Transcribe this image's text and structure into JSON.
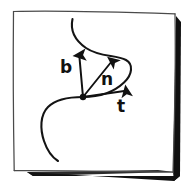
{
  "figure": {
    "title": "Frenet frame sketch",
    "style": "hand-drawn pen sketch",
    "canvas": {
      "width": 186,
      "height": 187
    },
    "colors": {
      "ink": "#111111",
      "paper": "#ffffff",
      "shadow": "#0d0d0d",
      "frame_line": "#5a5a5a"
    }
  },
  "frame": {
    "name": "sketched-square-border",
    "corners": [
      {
        "x": 13,
        "y": 11
      },
      {
        "x": 175,
        "y": 14
      },
      {
        "x": 173,
        "y": 173
      },
      {
        "x": 14,
        "y": 171
      }
    ],
    "shadow": {
      "side": "bottom-right",
      "thickness": 7
    }
  },
  "curve": {
    "name": "space-curve",
    "shape": "S-curve",
    "start_point": {
      "x": 72,
      "y": 19
    },
    "end_point": {
      "x": 58,
      "y": 161
    },
    "rightmost_point": {
      "x": 131,
      "y": 66
    },
    "leftmost_point": {
      "x": 41,
      "y": 124
    }
  },
  "base_point": {
    "name": "point-on-curve",
    "x": 83,
    "y": 97,
    "radius": 3.2
  },
  "vectors": [
    {
      "id": "binormal",
      "label": "b",
      "symbol": "b",
      "meaning": "binormal vector",
      "tail": {
        "x": 83,
        "y": 97
      },
      "tip": {
        "x": 79,
        "y": 49
      },
      "label_pos": {
        "x": 60,
        "y": 73
      }
    },
    {
      "id": "normal",
      "label": "n",
      "symbol": "n",
      "meaning": "normal vector",
      "tail": {
        "x": 83,
        "y": 97
      },
      "tip": {
        "x": 116,
        "y": 56
      },
      "label_pos": {
        "x": 101,
        "y": 85
      }
    },
    {
      "id": "tangent",
      "label": "t",
      "symbol": "t",
      "meaning": "tangent vector",
      "tail": {
        "x": 83,
        "y": 97
      },
      "tip": {
        "x": 131,
        "y": 90
      },
      "label_pos": {
        "x": 117,
        "y": 112
      }
    }
  ]
}
